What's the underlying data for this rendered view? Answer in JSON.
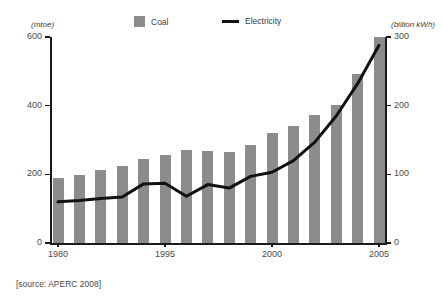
{
  "legend": {
    "coal_label": "Coal",
    "electricity_label": "Electricity",
    "coal_color": "#8c8c8c",
    "electricity_color": "#111111"
  },
  "axes": {
    "left_unit": "(mtoe)",
    "right_unit": "(billion kWh)",
    "left_ticks": [
      "0",
      "200",
      "400",
      "600"
    ],
    "right_ticks": [
      "0",
      "100",
      "200",
      "300"
    ],
    "x_labels": [
      "1980",
      "1995",
      "2000",
      "2005"
    ]
  },
  "source_note": "[source: APERC 2008]",
  "chart_data": {
    "type": "bar",
    "title": "",
    "subtitle": "",
    "xlabel": "",
    "ylabel": "(mtoe)",
    "y2label": "(billion kWh)",
    "grid": false,
    "legend_position": "top",
    "categories": [
      "1980",
      "1981",
      "1982",
      "1983",
      "1984",
      "1995",
      "1996",
      "1997",
      "1998",
      "1999",
      "2000",
      "2001",
      "2002",
      "2003",
      "2004",
      "2005"
    ],
    "x_tick_labels": [
      "1980",
      "1995",
      "2000",
      "2005"
    ],
    "ylim": [
      0,
      600
    ],
    "y2lim": [
      0,
      300
    ],
    "series": [
      {
        "name": "Coal",
        "type": "bar",
        "axis": "left",
        "unit": "mtoe",
        "color": "#8c8c8c",
        "values": [
          190,
          197,
          213,
          225,
          246,
          256,
          270,
          268,
          266,
          285,
          320,
          342,
          372,
          402,
          492,
          600
        ]
      },
      {
        "name": "Electricity",
        "type": "line",
        "axis": "right",
        "unit": "billion kWh",
        "color": "#111111",
        "values": [
          60,
          62,
          65,
          67,
          86,
          87,
          68,
          85,
          80,
          97,
          103,
          120,
          147,
          185,
          232,
          288
        ]
      }
    ]
  }
}
